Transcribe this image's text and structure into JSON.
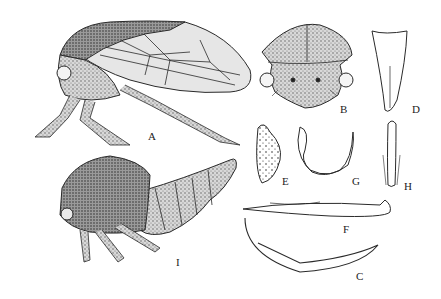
{
  "plate": {
    "figures": [
      {
        "id": "A",
        "label": "A",
        "subject": "adult treehopper, lateral view"
      },
      {
        "id": "B",
        "label": "B",
        "subject": "head, frontal view"
      },
      {
        "id": "C",
        "label": "C",
        "subject": "ovipositor / valvula"
      },
      {
        "id": "D",
        "label": "D",
        "subject": "elongate plate"
      },
      {
        "id": "E",
        "label": "E",
        "subject": "stippled plate"
      },
      {
        "id": "F",
        "label": "F",
        "subject": "aedeagus / style, lateral"
      },
      {
        "id": "G",
        "label": "G",
        "subject": "hooked style"
      },
      {
        "id": "H",
        "label": "H",
        "subject": "narrow process"
      },
      {
        "id": "I",
        "label": "I",
        "subject": "nymph, lateral view"
      }
    ],
    "colors": {
      "ink": "#2a2a2a",
      "stipple": "#6a6a6a",
      "paper": "#ffffff"
    }
  }
}
